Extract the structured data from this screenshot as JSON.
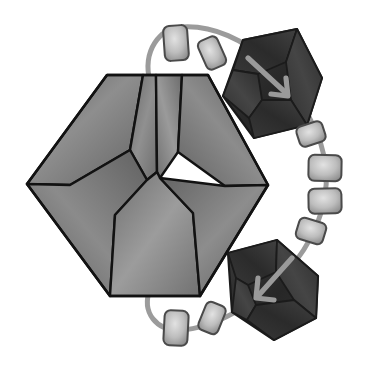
{
  "figure": {
    "background_color": "#ffffff",
    "width": 369,
    "height": 371,
    "outline_color": "#141414",
    "style": "grayscale shaded polyhedral diagram"
  },
  "main_crystal": {
    "name": "large-faceted-polyhedron",
    "outline_color": "#121212",
    "base_fill": "#6e6e6e",
    "highlight_fill": "#949494",
    "shadow_fill": "#5a5a5a",
    "facet_count": 8,
    "vertices": {
      "left": [
        27,
        184
      ],
      "right": [
        268,
        185
      ],
      "top_left": [
        107,
        75
      ],
      "top_right": [
        208,
        75
      ],
      "bottom_left": [
        110,
        296
      ],
      "bottom_right": [
        200,
        296
      ]
    },
    "facets": [
      {
        "label": "upper-left-facet",
        "tone": "#6b6b6b"
      },
      {
        "label": "upper-middle-left-facet",
        "tone": "#7d7d7d"
      },
      {
        "label": "upper-middle-right-facet",
        "tone": "#878787"
      },
      {
        "label": "upper-right-facet",
        "tone": "#707070"
      },
      {
        "label": "lower-left-facet",
        "tone": "#686868"
      },
      {
        "label": "lower-middle-facet",
        "tone": "#8a8a8a"
      },
      {
        "label": "lower-right-facet",
        "tone": "#6d6d6d"
      },
      {
        "label": "center-seam-facet",
        "tone": "#828282"
      }
    ]
  },
  "dark_units": [
    {
      "name": "top-right-dark-polyhedron",
      "center": [
        272,
        88
      ],
      "fill": "#2f2f2f",
      "edge_fill": "#3d3d3d",
      "outline_color": "#1a1a1a",
      "arrow": {
        "name": "arrow-down-right",
        "direction": "down-right",
        "color": "#9a9a9a",
        "from": [
          248,
          58
        ],
        "to": [
          288,
          95
        ]
      }
    },
    {
      "name": "bottom-right-dark-polyhedron",
      "center": [
        271,
        288
      ],
      "fill": "#2f2f2f",
      "edge_fill": "#3d3d3d",
      "outline_color": "#1a1a1a",
      "arrow": {
        "name": "arrow-down-left",
        "direction": "down-left",
        "color": "#9a9a9a",
        "from": [
          292,
          258
        ],
        "to": [
          255,
          298
        ]
      }
    }
  ],
  "chain": {
    "name": "linker-chain",
    "connector_color": "#9b9b9b",
    "connector_width": 5,
    "link_fill_center": "#d6d6d6",
    "link_fill_edge": "#8f8f8f",
    "link_outline": "#4a4a4a",
    "link_count": 8,
    "links": [
      {
        "name": "chain-link-1",
        "cx": 176,
        "cy": 43,
        "w": 24,
        "h": 35,
        "rot": -4
      },
      {
        "name": "chain-link-2",
        "cx": 212,
        "cy": 53,
        "w": 21,
        "h": 31,
        "rot": -24
      },
      {
        "name": "chain-link-3",
        "cx": 311,
        "cy": 134,
        "w": 27,
        "h": 21,
        "rot": -18
      },
      {
        "name": "chain-link-4",
        "cx": 325,
        "cy": 168,
        "w": 33,
        "h": 26,
        "rot": 1
      },
      {
        "name": "chain-link-5",
        "cx": 325,
        "cy": 201,
        "w": 33,
        "h": 25,
        "rot": -1
      },
      {
        "name": "chain-link-6",
        "cx": 311,
        "cy": 231,
        "w": 28,
        "h": 22,
        "rot": 17
      },
      {
        "name": "chain-link-7",
        "cx": 212,
        "cy": 318,
        "w": 21,
        "h": 30,
        "rot": 22
      },
      {
        "name": "chain-link-8",
        "cx": 176,
        "cy": 328,
        "w": 24,
        "h": 35,
        "rot": 3
      }
    ],
    "arc_path": "M 150,82 C 142,50 160,30 180,28 C 210,24 245,38 268,62 C 300,96 322,130 326,170 C 330,208 312,244 286,272 C 258,302 214,328 180,330 C 158,331 142,314 150,290"
  }
}
